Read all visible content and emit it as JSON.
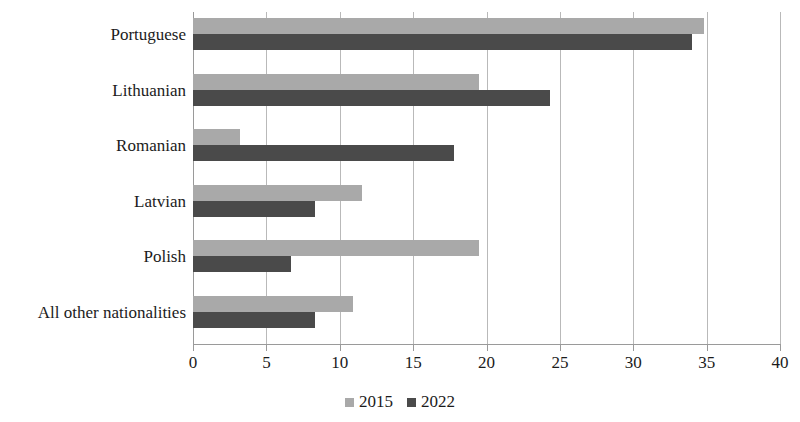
{
  "chart_data": {
    "type": "bar",
    "orientation": "horizontal",
    "title": "",
    "subtitle": "",
    "xlabel": "",
    "ylabel": "",
    "categories": [
      "Portuguese",
      "Lithuanian",
      "Romanian",
      "Latvian",
      "Polish",
      "All other nationalities"
    ],
    "series": [
      {
        "name": "2015",
        "color": "#a9a9a9",
        "values": [
          34.8,
          19.5,
          3.2,
          11.5,
          19.5,
          10.9
        ]
      },
      {
        "name": "2022",
        "color": "#4a4a4a",
        "values": [
          34.0,
          24.3,
          17.8,
          8.3,
          6.7,
          8.3
        ]
      }
    ],
    "xlim": [
      0,
      40
    ],
    "xticks": [
      0,
      5,
      10,
      15,
      20,
      25,
      30,
      35,
      40
    ],
    "xtick_labels": [
      "0",
      "5",
      "10",
      "15",
      "20",
      "25",
      "30",
      "35",
      "40"
    ],
    "grid": "vertical",
    "legend_position": "bottom",
    "legend_entries": [
      "2015",
      "2022"
    ]
  },
  "colors": {
    "series_2015": "#a9a9a9",
    "series_2022": "#4a4a4a",
    "gridline": "#b9b9b9",
    "axis": "#9a9a9a",
    "text": "#1b1b1b",
    "background": "#ffffff"
  }
}
